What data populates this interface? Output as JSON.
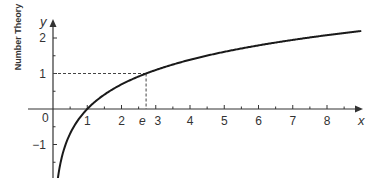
{
  "chart_data": {
    "type": "line",
    "title": "",
    "ylabel": "Number Theory",
    "xlabel": "x",
    "y_axis_var": "y",
    "function": "y = ln(x)",
    "xlim": [
      0,
      9
    ],
    "ylim": [
      -2,
      2.5
    ],
    "x_ticks": [
      1,
      2,
      3,
      4,
      5,
      6,
      7,
      8
    ],
    "x_tick_labels": [
      "1",
      "2",
      "3",
      "4",
      "5",
      "6",
      "7",
      "8"
    ],
    "x_minor_step": 0.5,
    "y_ticks": [
      -1,
      1,
      2
    ],
    "y_tick_labels": [
      "−1",
      "1",
      "2"
    ],
    "y_minor_step": 0.5,
    "origin_label": "0",
    "annotation": {
      "label": "e",
      "x": 2.718,
      "y": 1,
      "style": "dashed guide lines to both axes"
    },
    "series": [
      {
        "name": "ln(x)",
        "x_range": [
          0.135,
          9
        ],
        "points": [
          [
            0.135,
            -2.0
          ],
          [
            0.2,
            -1.609
          ],
          [
            0.3,
            -1.204
          ],
          [
            0.5,
            -0.693
          ],
          [
            0.75,
            -0.288
          ],
          [
            1,
            0
          ],
          [
            1.5,
            0.405
          ],
          [
            2,
            0.693
          ],
          [
            2.718,
            1
          ],
          [
            3,
            1.099
          ],
          [
            4,
            1.386
          ],
          [
            5,
            1.609
          ],
          [
            6,
            1.792
          ],
          [
            7,
            1.946
          ],
          [
            8,
            2.079
          ],
          [
            9,
            2.197
          ]
        ]
      }
    ],
    "grid": false,
    "legend": "none",
    "colors": {
      "curve": "#1a1a1a",
      "axis": "#333333",
      "guide": "#444444"
    }
  }
}
